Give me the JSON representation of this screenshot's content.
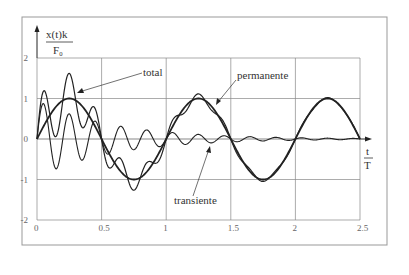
{
  "chart_data": {
    "type": "line",
    "title": "",
    "ylabel": {
      "numerator": "x(t)k",
      "denominator": "F₀"
    },
    "xlabel": {
      "numerator": "t",
      "denominator": "T"
    },
    "xlim": [
      0,
      2.5
    ],
    "ylim": [
      -2,
      2
    ],
    "x_ticks": [
      "0",
      "0.5",
      "1",
      "1.5",
      "2",
      "2.5"
    ],
    "y_ticks": [
      "2",
      "1",
      "0",
      "-1",
      "-2"
    ],
    "grid": true,
    "annotations": [
      {
        "text": "total",
        "points_to": "total curve near t≈0.25"
      },
      {
        "text": "permanente",
        "points_to": "permanente curve near t≈0.4"
      },
      {
        "text": "transiente",
        "points_to": "transiente curve near t≈1.2"
      }
    ],
    "series": [
      {
        "name": "permanente",
        "description": "steady-state sinusoid, amplitude ≈1, period 1",
        "x": [
          0,
          0.125,
          0.25,
          0.375,
          0.5,
          0.625,
          0.75,
          0.875,
          1.0,
          1.25,
          1.5,
          1.75,
          2.0,
          2.25,
          2.5
        ],
        "values": [
          0,
          0.71,
          1.0,
          0.71,
          0,
          -0.71,
          -1.0,
          -0.71,
          0,
          1.0,
          0,
          -1.0,
          0,
          1.0,
          0
        ]
      },
      {
        "name": "transiente",
        "description": "decaying oscillation, ≈5 cycles per unit t, initial amplitude ≈1",
        "x": [
          0,
          0.05,
          0.15,
          0.25,
          0.35,
          0.45,
          0.55,
          0.75,
          1.0,
          1.5,
          2.0,
          2.5
        ],
        "values": [
          0,
          0.8,
          -0.65,
          0.55,
          -0.45,
          0.35,
          -0.3,
          0.2,
          0.1,
          0.03,
          0.01,
          0
        ]
      },
      {
        "name": "total",
        "description": "sum of permanente and transiente",
        "x": [
          0,
          0.05,
          0.1,
          0.25,
          0.35,
          0.45,
          0.55,
          0.75,
          1.0,
          1.25,
          1.5,
          1.75,
          2.0,
          2.25,
          2.5
        ],
        "values": [
          0,
          1.1,
          0.45,
          1.6,
          0.35,
          0.6,
          -0.6,
          -1.3,
          0.1,
          1.0,
          0,
          -1.05,
          0,
          1.0,
          0
        ]
      }
    ]
  },
  "colors": {
    "curve": "#222222",
    "grid": "#888888",
    "frame": "#999999",
    "text": "#333333"
  }
}
